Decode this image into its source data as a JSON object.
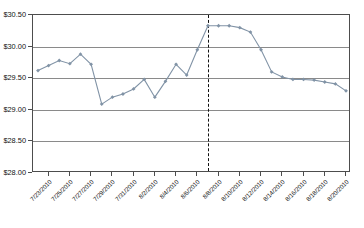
{
  "chart_data": {
    "type": "line",
    "title": "",
    "xlabel": "",
    "ylabel": "",
    "ylim": [
      28.0,
      30.5
    ],
    "ytick_values": [
      28.0,
      28.5,
      29.0,
      29.5,
      30.0,
      30.5
    ],
    "ytick_labels": [
      "$28.00",
      "$28.50",
      "$29.00",
      "$29.50",
      "$30.00",
      "$30.50"
    ],
    "grid": true,
    "legend": "none",
    "marker": "diamond",
    "line_color": "#8193a6",
    "marker_color": "#8193a6",
    "grid_color": "#8a8a8a",
    "axis_color": "#4d4d4d",
    "xtick_labels": [
      "7/23/2010",
      "7/25/2010",
      "7/27/2010",
      "7/29/2010",
      "7/31/2010",
      "8/2/2010",
      "8/4/2010",
      "8/6/2010",
      "8/8/2010",
      "8/10/2010",
      "8/12/2010",
      "8/14/2010",
      "8/16/2010",
      "8/18/2010",
      "8/20/2010"
    ],
    "x": [
      "7/22/2010",
      "7/23/2010",
      "7/24/2010",
      "7/25/2010",
      "7/26/2010",
      "7/27/2010",
      "7/28/2010",
      "7/29/2010",
      "7/30/2010",
      "7/31/2010",
      "8/1/2010",
      "8/2/2010",
      "8/3/2010",
      "8/4/2010",
      "8/5/2010",
      "8/6/2010",
      "8/7/2010",
      "8/8/2010",
      "8/9/2010",
      "8/10/2010",
      "8/11/2010",
      "8/12/2010",
      "8/13/2010",
      "8/14/2010",
      "8/15/2010",
      "8/16/2010",
      "8/17/2010",
      "8/18/2010",
      "8/19/2010",
      "8/20/2010"
    ],
    "values": [
      29.62,
      29.7,
      29.78,
      29.73,
      29.88,
      29.72,
      29.09,
      29.2,
      29.25,
      29.33,
      29.48,
      29.2,
      29.45,
      29.72,
      29.55,
      29.95,
      30.33,
      30.33,
      30.33,
      30.3,
      30.23,
      29.95,
      29.6,
      29.52,
      29.48,
      29.48,
      29.47,
      29.44,
      29.41,
      29.3
    ],
    "annotations": [
      {
        "type": "vertical-dashed-line",
        "name": "event-marker",
        "x": "8/7/2010",
        "style": "dashed",
        "color": "#111111"
      }
    ]
  }
}
